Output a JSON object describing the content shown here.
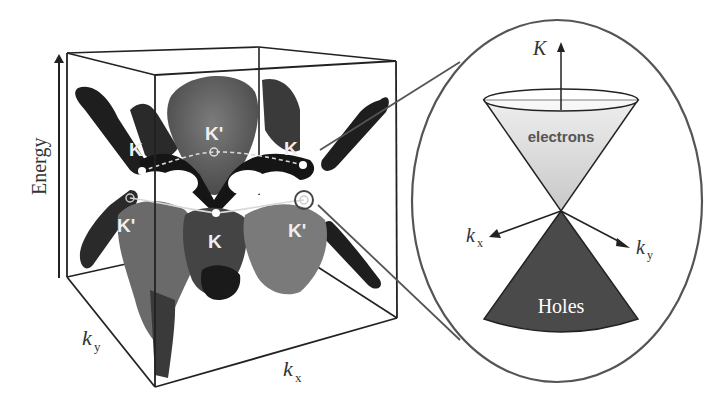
{
  "left_panel": {
    "axis_energy": "Energy",
    "axis_ky": "k",
    "axis_ky_sub": "y",
    "axis_kx": "k",
    "axis_kx_sub": "x",
    "points": {
      "k_top_left": "K",
      "kprime_top_center": "K'",
      "k_top_right": "K",
      "kprime_bottom_left": "K'",
      "k_bottom_center": "K",
      "kprime_bottom_right": "K'"
    }
  },
  "right_panel": {
    "axis_K": "K",
    "axis_kx": "k",
    "axis_kx_sub": "x",
    "axis_ky": "k",
    "axis_ky_sub": "y",
    "upper_cone_label": "electrons",
    "lower_cone_label": "Holes"
  },
  "colors": {
    "surface_dark": "#1e1e1e",
    "surface_mid": "#5a5a5a",
    "surface_light": "#7a7a7a",
    "electrons_fill": "#d2d2d2",
    "holes_fill": "#4a4a4a",
    "outline": "#4a4a4a"
  }
}
